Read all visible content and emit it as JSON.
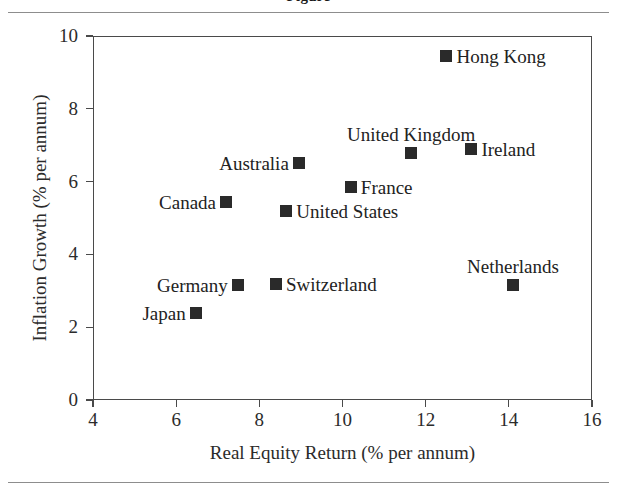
{
  "page": {
    "title_cropped": "Figure",
    "top_rule": true,
    "bottom_rule": true
  },
  "chart_data": {
    "type": "scatter",
    "title": "",
    "xlabel": "Real Equity Return (% per annum)",
    "ylabel": "Inflation Growth (% per annum)",
    "xlim": [
      4,
      16
    ],
    "ylim": [
      0,
      10
    ],
    "xticks": [
      4,
      6,
      8,
      10,
      12,
      14,
      16
    ],
    "yticks": [
      0,
      2,
      4,
      6,
      8,
      10
    ],
    "grid": false,
    "legend": "none",
    "marker_color": "#2a2a2a",
    "marker_shape": "square",
    "points": [
      {
        "label": "Hong Kong",
        "x": 12.5,
        "y": 9.45,
        "label_pos": "right"
      },
      {
        "label": "Ireland",
        "x": 13.1,
        "y": 6.9,
        "label_pos": "right"
      },
      {
        "label": "United Kingdom",
        "x": 11.65,
        "y": 6.78,
        "label_pos": "above"
      },
      {
        "label": "Australia",
        "x": 8.95,
        "y": 6.5,
        "label_pos": "left"
      },
      {
        "label": "France",
        "x": 10.2,
        "y": 5.85,
        "label_pos": "right"
      },
      {
        "label": "Canada",
        "x": 7.2,
        "y": 5.45,
        "label_pos": "left"
      },
      {
        "label": "United States",
        "x": 8.65,
        "y": 5.2,
        "label_pos": "right"
      },
      {
        "label": "Netherlands",
        "x": 14.1,
        "y": 3.17,
        "label_pos": "above"
      },
      {
        "label": "Switzerland",
        "x": 8.4,
        "y": 3.2,
        "label_pos": "right"
      },
      {
        "label": "Germany",
        "x": 7.48,
        "y": 3.17,
        "label_pos": "left"
      },
      {
        "label": "Japan",
        "x": 6.47,
        "y": 2.4,
        "label_pos": "left"
      }
    ]
  }
}
